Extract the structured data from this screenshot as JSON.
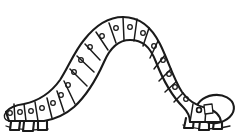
{
  "image": {
    "title": "Caterpillar",
    "style": "black-and-white line art",
    "subject": "caterpillar",
    "pose": "arched inverted-U crawling posture",
    "width": 247,
    "height": 136,
    "background_color": "#ffffff",
    "line_color": "#1a1a1a"
  },
  "subject": {
    "name": "caterpillar",
    "body_label": "segmented body",
    "head_label": "head",
    "tail_label": "tail segment",
    "leg_label": "proleg",
    "spiracle_label": "spiracle dot",
    "segment_count": 20,
    "spiracle_count": 19,
    "leg_count": 6,
    "head_position": "right",
    "tail_position": "left"
  },
  "geometry": {
    "outer_arc": "M 12 122 C 10 108, 18 100, 30 96 C 48 90, 58 78, 66 60 C 76 38, 92 20, 118 17 C 146 14, 164 30, 174 54 C 184 78, 192 94, 206 99 C 220 104, 228 112, 226 122",
    "inner_arc": "M 44 122 C 42 114, 48 110, 58 106 C 72 100, 82 86, 90 68 C 98 50, 106 42, 120 41 C 136 40, 146 50, 152 68 C 160 88, 170 102, 186 107 C 198 111, 204 116, 202 122",
    "tail_cap": "M 12 122 C 6 120, 3 116, 6 112 C 9 108, 16 106, 22 106",
    "head_oval": {
      "cx": 215,
      "cy": 109,
      "rx": 19,
      "ry": 14,
      "rotation": -8
    }
  },
  "segments": [
    {
      "id": 1,
      "divider": "M 30 96 L 44 118",
      "dot": {
        "cx": 34,
        "cy": 106,
        "r": 2.4
      }
    },
    {
      "id": 2,
      "divider": "M 40 93 L 52 114",
      "dot": {
        "cx": 45,
        "cy": 104,
        "r": 2.4
      }
    },
    {
      "id": 3,
      "divider": "M 51 88 L 61 110",
      "dot": {
        "cx": 56,
        "cy": 100,
        "r": 2.4
      }
    },
    {
      "id": 4,
      "divider": "M 60 80 L 72 100",
      "dot": {
        "cx": 65,
        "cy": 92,
        "r": 2.4
      }
    },
    {
      "id": 5,
      "divider": "M 66 68 L 80 86",
      "dot": {
        "cx": 71,
        "cy": 78,
        "r": 2.4
      }
    },
    {
      "id": 6,
      "divider": "M 72 56 L 88 72",
      "dot": {
        "cx": 77,
        "cy": 65,
        "r": 2.4
      }
    },
    {
      "id": 7,
      "divider": "M 80 44 L 95 58",
      "dot": {
        "cx": 85,
        "cy": 52,
        "r": 2.4
      }
    },
    {
      "id": 8,
      "divider": "M 91 33 L 103 49",
      "dot": {
        "cx": 95,
        "cy": 42,
        "r": 2.4
      }
    },
    {
      "id": 9,
      "divider": "M 103 24 L 112 44",
      "dot": {
        "cx": 107,
        "cy": 34,
        "r": 2.4
      }
    },
    {
      "id": 10,
      "divider": "M 117 18 L 122 41",
      "dot": {
        "cx": 120,
        "cy": 29,
        "r": 2.4
      }
    },
    {
      "id": 11,
      "divider": "M 131 19 L 133 41",
      "dot": {
        "cx": 133,
        "cy": 29,
        "r": 2.4
      }
    },
    {
      "id": 12,
      "divider": "M 145 25 L 143 45",
      "dot": {
        "cx": 145,
        "cy": 34,
        "r": 2.4
      }
    },
    {
      "id": 13,
      "divider": "M 157 35 L 150 54",
      "dot": {
        "cx": 155,
        "cy": 44,
        "r": 2.4
      }
    },
    {
      "id": 14,
      "divider": "M 166 48 L 156 65",
      "dot": {
        "cx": 164,
        "cy": 56,
        "r": 2.4
      }
    },
    {
      "id": 15,
      "divider": "M 172 62 L 160 77",
      "dot": {
        "cx": 171,
        "cy": 70,
        "r": 2.4
      }
    },
    {
      "id": 16,
      "divider": "M 178 76 L 166 89",
      "dot": {
        "cx": 177,
        "cy": 83,
        "r": 2.4
      }
    },
    {
      "id": 17,
      "divider": "M 186 88 L 175 100",
      "dot": {
        "cx": 184,
        "cy": 95,
        "r": 2.4
      }
    },
    {
      "id": 18,
      "divider": "M 196 96 L 190 118",
      "dot": {
        "cx": 194,
        "cy": 105,
        "r": 2.4
      }
    },
    {
      "id": 19,
      "divider": "M 206 99 L 203 120",
      "dot": {
        "cx": 201,
        "cy": 108,
        "r": 2.4
      }
    }
  ],
  "tail_segments": [
    {
      "id": "t1",
      "divider": "M 22 106 L 24 122"
    },
    {
      "id": "t2",
      "divider": "M 6 112 L 9 121"
    }
  ],
  "tail_dots": [
    {
      "cx": 16,
      "cy": 113,
      "r": 2.4
    },
    {
      "cx": 27,
      "cy": 112,
      "r": 2.4
    }
  ],
  "legs": [
    {
      "id": "l1",
      "path": "M 11 122 L 10 130 L 19 130 L 20 122",
      "side": "left"
    },
    {
      "id": "l2",
      "path": "M 24 122 L 23 131 L 33 131 L 34 122",
      "side": "left"
    },
    {
      "id": "l3",
      "path": "M 38 121 L 38 130 L 47 130 L 47 121",
      "side": "left"
    },
    {
      "id": "l4",
      "path": "M 186 118 L 184 128 L 193 128 L 194 118",
      "side": "right"
    },
    {
      "id": "l5",
      "path": "M 200 121 L 199 130 L 209 130 L 209 121",
      "side": "right"
    },
    {
      "id": "l6",
      "path": "M 214 121 L 213 129 L 222 129 L 222 121",
      "side": "right"
    }
  ],
  "ground_lines": [
    {
      "id": "g1",
      "path": "M 6 126 C 14 129, 30 131, 48 129"
    },
    {
      "id": "g2",
      "path": "M 183 125 C 194 129, 212 131, 230 126"
    }
  ],
  "head_details": {
    "mouth_line": "M 196 118 C 204 124, 214 126, 224 122",
    "eye": {
      "cx": 200,
      "cy": 104,
      "r": 2.6
    },
    "mandible": "M 205 100 L 213 100 L 213 108 L 205 108 Z",
    "neck_line": "M 196 96 C 199 104, 199 114, 196 120"
  },
  "accent_colors": {
    "ink": "#1a1a1a",
    "paper": "#ffffff"
  }
}
